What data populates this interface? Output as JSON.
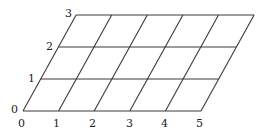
{
  "diagram": {
    "type": "skewed-grid",
    "colors": {
      "line": "#3a3a3a",
      "label": "#222222",
      "background": "#ffffff"
    },
    "x_axis": {
      "labels": [
        "0",
        "1",
        "2",
        "3",
        "4",
        "5"
      ]
    },
    "y_axis": {
      "labels": [
        "0",
        "1",
        "2",
        "3"
      ]
    },
    "geometry": {
      "origin": [
        23,
        111
      ],
      "col_step": 35.6,
      "row_step_y": -32,
      "row_step_x": 17.7,
      "cols": 5,
      "rows": 3
    }
  }
}
